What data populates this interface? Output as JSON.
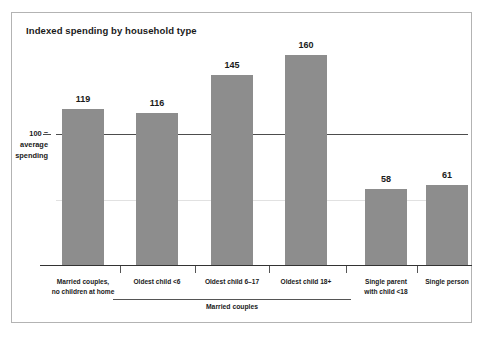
{
  "chart_data": {
    "type": "bar",
    "title": "Indexed spending by household type",
    "xlabel": "",
    "ylabel": "100 = average spending",
    "categories": [
      "Married couples,\nno children at home",
      "Oldest child <6",
      "Oldest child 6–17",
      "Oldest child 18+",
      "Single parent\nwith child <18",
      "Single person"
    ],
    "values": [
      119,
      116,
      145,
      160,
      58,
      61
    ],
    "reference_line": 100,
    "reference_label_lines": [
      "100 =",
      "average",
      "spending"
    ],
    "ylim": [
      0,
      175
    ],
    "grid": "faint-horizontal-at-50",
    "gridline_values": [
      50
    ],
    "legend": "none",
    "group_brackets": [
      {
        "label": "Married couples",
        "covers": [
          "Oldest child <6",
          "Oldest child 6–17",
          "Oldest child 18+"
        ]
      }
    ],
    "bar_color": "#8d8d8d",
    "reference_line_color": "#4d4d4d",
    "axis_color": "#333333",
    "frame_color": "#b3b3b3",
    "background_color": "#ffffff"
  },
  "bars": [
    {
      "value_label": "119",
      "category_line1": "Married couples,",
      "category_line2": "no children at home"
    },
    {
      "value_label": "116",
      "category_line1": "Oldest child <6",
      "category_line2": ""
    },
    {
      "value_label": "145",
      "category_line1": "Oldest child 6–17",
      "category_line2": ""
    },
    {
      "value_label": "160",
      "category_line1": "Oldest child 18+",
      "category_line2": ""
    },
    {
      "value_label": "58",
      "category_line1": "Single parent",
      "category_line2": "with child <18"
    },
    {
      "value_label": "61",
      "category_line1": "Single person",
      "category_line2": ""
    }
  ],
  "y_axis": {
    "line1": "100 =",
    "line2": "average",
    "line3": "spending"
  },
  "group": {
    "label": "Married couples"
  }
}
